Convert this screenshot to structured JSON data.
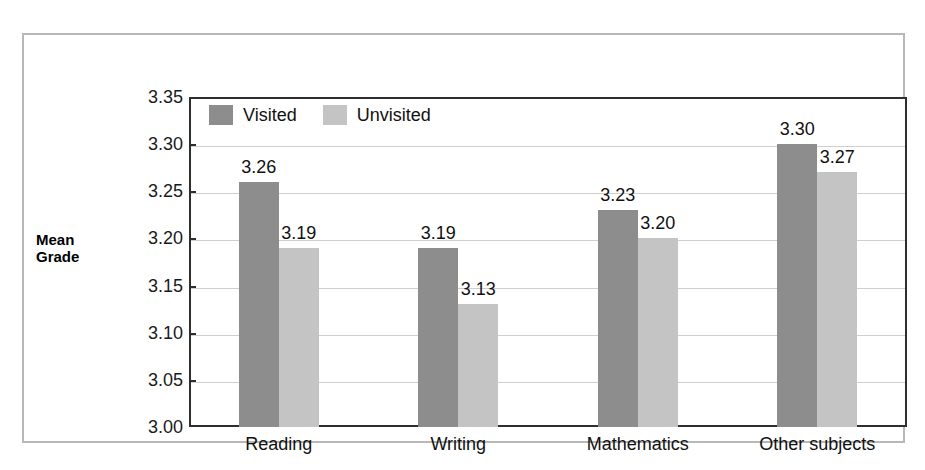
{
  "chart_data": {
    "type": "bar",
    "title": "",
    "subtitle": "",
    "xlabel": "",
    "ylabel": "Mean\nGrade",
    "categories": [
      "Reading",
      "Writing",
      "Mathematics",
      "Other subjects"
    ],
    "series": [
      {
        "name": "Visited",
        "color": "#8d8d8d",
        "values": [
          3.26,
          3.19,
          3.23,
          3.3
        ],
        "labels": [
          "3.26",
          "3.19",
          "3.23",
          "3.30"
        ]
      },
      {
        "name": "Unvisited",
        "color": "#c4c4c4",
        "values": [
          3.19,
          3.13,
          3.2,
          3.27
        ],
        "labels": [
          "3.19",
          "3.13",
          "3.20",
          "3.27"
        ]
      }
    ],
    "ylim": [
      3.0,
      3.35
    ],
    "ytick_step": 0.05,
    "ytick_labels": [
      "3.35",
      "3.30",
      "3.25",
      "3.20",
      "3.15",
      "3.10",
      "3.05",
      "3.00"
    ],
    "ytick_values": [
      3.35,
      3.3,
      3.25,
      3.2,
      3.15,
      3.1,
      3.05,
      3.0
    ],
    "grid": true,
    "legend_position": "top-left",
    "legend": [
      "Visited",
      "Unvisited"
    ]
  },
  "colors": {
    "visited": "#8d8d8d",
    "unvisited": "#c4c4c4",
    "gridline": "#cfcfcf",
    "axis": "#2e2e2e",
    "frame": "#b8b8b8",
    "background": "#ffffff",
    "text": "#111111"
  }
}
